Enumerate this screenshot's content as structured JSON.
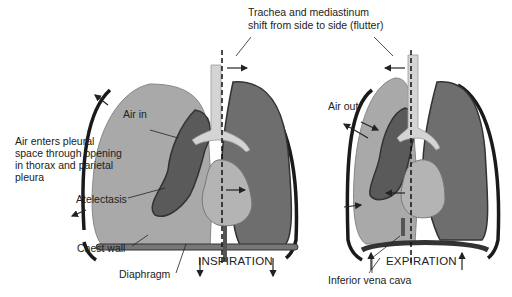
{
  "title_label": {
    "line1": "Trachea and mediastinum",
    "line2": "shift from side to side (flutter)"
  },
  "left_panel": {
    "caption": "INSPIRATION",
    "labels": {
      "air_in": "Air in",
      "air_enters_1": "Air enters pleural",
      "air_enters_2": "space through opening",
      "air_enters_3": "in thorax and parietal",
      "air_enters_4": "pleura",
      "atelectasis": "Atelectasis",
      "chest_wall": "Chest wall",
      "diaphragm": "Diaphragm"
    }
  },
  "right_panel": {
    "caption": "EXPIRATION",
    "labels": {
      "air_out": "Air out",
      "inferior_vena_cava": "Inferior vena cava"
    }
  },
  "colors": {
    "pleural_space": "#a9a9a9",
    "lung_tissue": "#6e6e6e",
    "collapsed_lung": "#5a5a5a",
    "airway": "#d4d4d4",
    "heart": "#b4b4b4",
    "chest_wall": "#1a1a1a"
  }
}
